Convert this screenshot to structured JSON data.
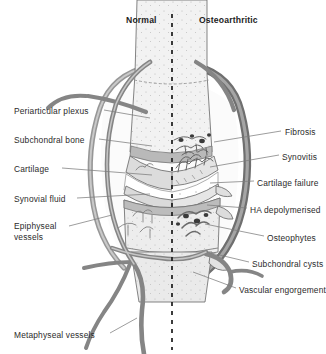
{
  "figure": {
    "type": "medical-diagram",
    "background_color": "#ffffff",
    "divider": {
      "name": "midline",
      "style": "dashed",
      "color": "#1a1a1a",
      "x": 172
    }
  },
  "headers": [
    {
      "id": "normal",
      "label": "Normal",
      "x": 126,
      "y": 15
    },
    {
      "id": "osteoarthritic",
      "label": "Osteoarthritic",
      "x": 199,
      "y": 15
    }
  ],
  "labels_left": [
    {
      "id": "periarticular-plexus",
      "label": "Periarticular plexus",
      "x": 14,
      "y": 106,
      "leader": [
        [
          104,
          110
        ],
        [
          150,
          118
        ]
      ]
    },
    {
      "id": "subchondral-bone",
      "label": "Subchondral bone",
      "x": 14,
      "y": 135,
      "leader": [
        [
          99,
          139
        ],
        [
          152,
          146
        ]
      ]
    },
    {
      "id": "cartilage",
      "label": "Cartilage",
      "x": 14,
      "y": 164,
      "leader": [
        [
          62,
          168
        ],
        [
          152,
          175
        ]
      ]
    },
    {
      "id": "synovial-fluid",
      "label": "Synovial fluid",
      "x": 14,
      "y": 194,
      "leader": [
        [
          77,
          198
        ],
        [
          150,
          194
        ]
      ]
    },
    {
      "id": "epiphyseal-vessels",
      "label": "Epiphyseal vessels",
      "x": 14,
      "y": 223,
      "wrap": true,
      "leader": [
        [
          69,
          226
        ],
        [
          112,
          215
        ]
      ]
    },
    {
      "id": "metaphyseal-vessels",
      "label": "Metaphyseal vessels",
      "x": 14,
      "y": 330,
      "leader": [
        [
          110,
          333
        ],
        [
          137,
          320
        ]
      ]
    }
  ],
  "labels_right": [
    {
      "id": "fibrosis",
      "label": "Fibrosis",
      "x": 285,
      "y": 127,
      "leader": [
        [
          281,
          131
        ],
        [
          214,
          142
        ]
      ]
    },
    {
      "id": "synovitis",
      "label": "Synovitis",
      "x": 282,
      "y": 152,
      "leader": [
        [
          279,
          155
        ],
        [
          210,
          167
        ]
      ]
    },
    {
      "id": "cartilage-failure",
      "label": "Cartilage failure",
      "x": 257,
      "y": 178,
      "leader": [
        [
          254,
          181
        ],
        [
          209,
          183
        ]
      ]
    },
    {
      "id": "ha-depolymerised",
      "label": "HA depolymerised",
      "x": 250,
      "y": 205,
      "leader": [
        [
          247,
          208
        ],
        [
          206,
          205
        ]
      ]
    },
    {
      "id": "osteophytes",
      "label": "Osteophytes",
      "x": 267,
      "y": 233,
      "leader": [
        [
          264,
          236
        ],
        [
          205,
          224
        ]
      ]
    },
    {
      "id": "subchondral-cysts",
      "label": "Subchondral cysts",
      "x": 252,
      "y": 259,
      "leader": [
        [
          249,
          262
        ],
        [
          206,
          252
        ]
      ]
    },
    {
      "id": "vascular-engorgement",
      "label": "Vascular engorgement",
      "x": 239,
      "y": 285,
      "leader": [
        [
          236,
          288
        ],
        [
          192,
          272
        ]
      ]
    }
  ],
  "anatomy": {
    "structures": [
      {
        "name": "joint-capsule",
        "side": "both",
        "color": "#8f8f8f"
      },
      {
        "name": "upper-epiphysis",
        "side": "both",
        "color": "#efefef"
      },
      {
        "name": "lower-epiphysis",
        "side": "both",
        "color": "#ececec"
      },
      {
        "name": "articular-cartilage",
        "side": "both",
        "color": "#d8d8d8"
      },
      {
        "name": "synovial-cavity",
        "side": "both",
        "color": "#fbfbfb"
      },
      {
        "name": "bone-shaft",
        "side": "both",
        "color": "#e9e9e9"
      },
      {
        "name": "periarticular-vessels",
        "side": "both",
        "color": "#7e7e7e"
      },
      {
        "name": "synovial-villi",
        "side": "right",
        "color": "#6c6c6c"
      },
      {
        "name": "subchondral-cyst-dots",
        "side": "right",
        "color": "#3c3c3c"
      },
      {
        "name": "osteophyte-spurs",
        "side": "right",
        "color": "#9a9a9a"
      }
    ],
    "palette": {
      "outline": "#5d5d5d",
      "vessel": "#8a8a8a",
      "vessel_dark": "#6a6a6a",
      "bone_light": "#f1f1f1",
      "bone_mid": "#e2e2e2",
      "cartilage": "#d6d6d6",
      "cavity": "#fcfcfc",
      "capsule_oa": "#7a7a7a",
      "marrow_dot": "#333333",
      "leader": "#7a7a7a"
    }
  }
}
